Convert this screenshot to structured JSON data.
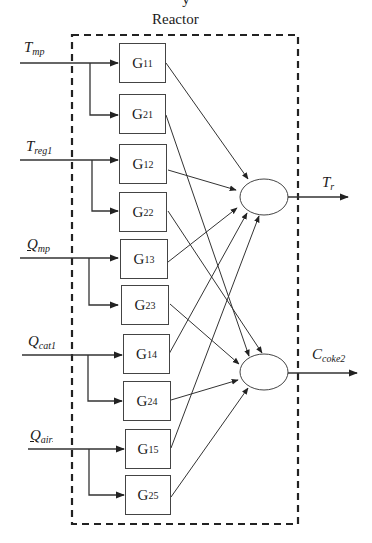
{
  "diagram": {
    "top_partial_text": "y",
    "container_label": "Reactor",
    "inputs": [
      {
        "id": "Tmp",
        "main": "T",
        "sub": "mp",
        "y": 63,
        "branch_to": [
          "G11",
          "G21"
        ]
      },
      {
        "id": "Treg1",
        "main": "T",
        "sub": "reg1",
        "y": 160,
        "branch_to": [
          "G12",
          "G22"
        ]
      },
      {
        "id": "Qmp",
        "main": "Q",
        "sub": "mp",
        "y": 258,
        "branch_to": [
          "G13",
          "G23"
        ]
      },
      {
        "id": "Qcat1",
        "main": "Q",
        "sub": "cat1",
        "y": 355,
        "branch_to": [
          "G14",
          "G24"
        ]
      },
      {
        "id": "Qair",
        "main": "Q",
        "sub": "air",
        "y": 449,
        "branch_to": [
          "G15",
          "G25"
        ]
      }
    ],
    "blocks": [
      {
        "id": "G11",
        "main": "G",
        "sub": "11",
        "to": "sum1"
      },
      {
        "id": "G21",
        "main": "G",
        "sub": "21",
        "to": "sum2"
      },
      {
        "id": "G12",
        "main": "G",
        "sub": "12",
        "to": "sum1"
      },
      {
        "id": "G22",
        "main": "G",
        "sub": "22",
        "to": "sum2"
      },
      {
        "id": "G13",
        "main": "G",
        "sub": "13",
        "to": "sum1"
      },
      {
        "id": "G23",
        "main": "G",
        "sub": "23",
        "to": "sum2"
      },
      {
        "id": "G14",
        "main": "G",
        "sub": "14",
        "to": "sum1"
      },
      {
        "id": "G24",
        "main": "G",
        "sub": "24",
        "to": "sum2"
      },
      {
        "id": "G15",
        "main": "G",
        "sub": "15",
        "to": "sum1"
      },
      {
        "id": "G25",
        "main": "G",
        "sub": "25",
        "to": "sum2"
      }
    ],
    "outputs": [
      {
        "id": "Tr",
        "main": "T",
        "sub": "r",
        "from": "sum1"
      },
      {
        "id": "Ccoke2",
        "main": "C",
        "sub": "coke2",
        "from": "sum2"
      }
    ],
    "colors": {
      "line": "#333333",
      "dash": "#222222",
      "box_border": "#444444"
    }
  }
}
